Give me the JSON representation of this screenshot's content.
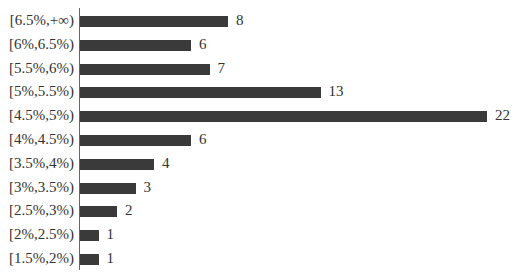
{
  "chart_data": {
    "type": "bar",
    "orientation": "horizontal",
    "title": "",
    "xlabel": "",
    "ylabel": "",
    "categories": [
      "[6.5%,+∞)",
      "[6%,6.5%)",
      "[5.5%,6%)",
      "[5%,5.5%)",
      "[4.5%,5%)",
      "[4%,4.5%)",
      "[3.5%,4%)",
      "[3%,3.5%)",
      "[2.5%,3%)",
      "[2%,2.5%)",
      "[1.5%,2%)"
    ],
    "values": [
      8,
      6,
      7,
      13,
      22,
      6,
      4,
      3,
      2,
      1,
      1
    ],
    "xlim": [
      0,
      22
    ],
    "grid": false,
    "legend": null,
    "data_labels": true,
    "bar_color": "#3a3a3a"
  }
}
